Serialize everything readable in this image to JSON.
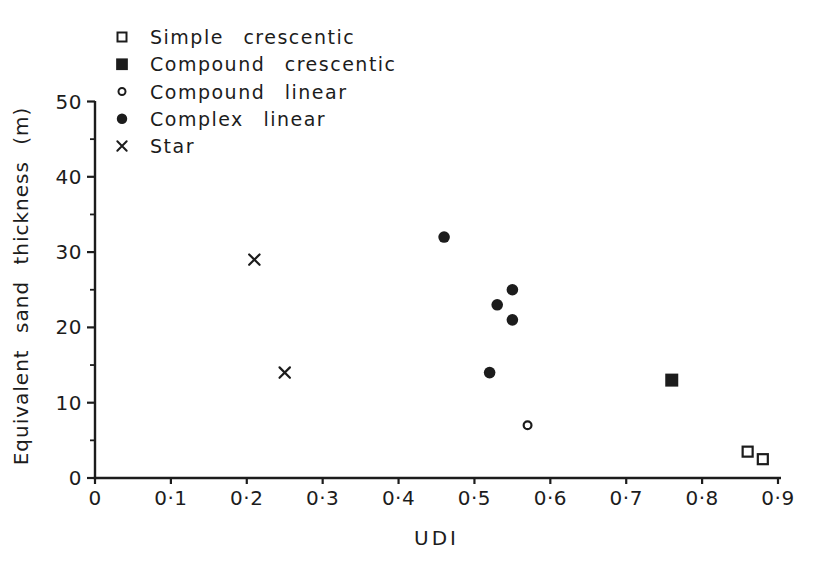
{
  "figure": {
    "ink": "#1c1c1c",
    "background": "#ffffff"
  },
  "chart_data": {
    "type": "scatter",
    "title": "",
    "xlabel": "UDI",
    "ylabel": "Equivalent  sand  thickness  (m)",
    "xlim": [
      0,
      0.9
    ],
    "ylim": [
      0,
      50
    ],
    "grid": false,
    "legend_position": "top-left-inside",
    "x_ticks": [
      0,
      0.1,
      0.2,
      0.3,
      0.4,
      0.5,
      0.6,
      0.7,
      0.8,
      0.9
    ],
    "x_tick_labels": [
      "0",
      "0·1",
      "0·2",
      "0·3",
      "0·4",
      "0·5",
      "0·6",
      "0·7",
      "0·8",
      "0·9"
    ],
    "y_ticks": [
      0,
      10,
      20,
      30,
      40,
      50
    ],
    "y_tick_labels": [
      "0",
      "10",
      "20",
      "30",
      "40",
      "50"
    ],
    "y_minor_ticks": [
      5,
      15,
      25,
      35,
      45
    ],
    "series": [
      {
        "name": "Simple  crescentic",
        "marker": "open-square",
        "points": [
          [
            0.86,
            3.5
          ],
          [
            0.88,
            2.5
          ]
        ]
      },
      {
        "name": "Compound  crescentic",
        "marker": "filled-square",
        "points": [
          [
            0.76,
            13
          ]
        ]
      },
      {
        "name": "Compound  linear",
        "marker": "open-circle",
        "points": [
          [
            0.57,
            7
          ]
        ]
      },
      {
        "name": "Complex  linear",
        "marker": "filled-circle",
        "points": [
          [
            0.46,
            32
          ],
          [
            0.55,
            25
          ],
          [
            0.53,
            23
          ],
          [
            0.55,
            21
          ],
          [
            0.52,
            14
          ]
        ]
      },
      {
        "name": "Star",
        "marker": "x",
        "points": [
          [
            0.21,
            29
          ],
          [
            0.25,
            14
          ]
        ]
      }
    ]
  }
}
